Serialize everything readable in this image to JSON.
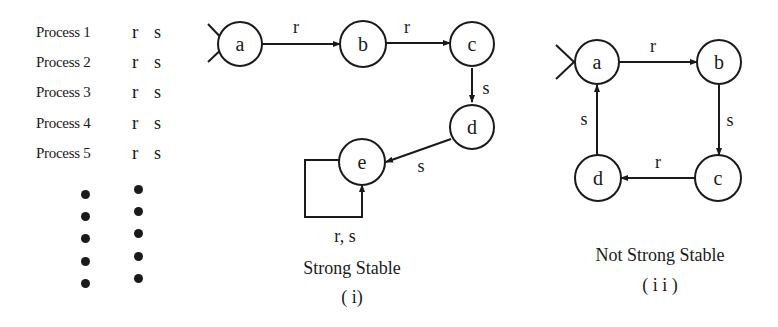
{
  "processes": [
    {
      "name": "Process 1",
      "r": "r",
      "s": "s"
    },
    {
      "name": "Process 2",
      "r": "r",
      "s": "s"
    },
    {
      "name": "Process 3",
      "r": "r",
      "s": "s"
    },
    {
      "name": "Process 4",
      "r": "r",
      "s": "s"
    },
    {
      "name": "Process 5",
      "r": "r",
      "s": "s"
    }
  ],
  "ellipsis_dots": 5,
  "diagram_i": {
    "caption": "Strong Stable",
    "label": "( i)",
    "nodes": [
      {
        "id": "a",
        "label": "a",
        "start": true
      },
      {
        "id": "b",
        "label": "b"
      },
      {
        "id": "c",
        "label": "c"
      },
      {
        "id": "d",
        "label": "d"
      },
      {
        "id": "e",
        "label": "e"
      }
    ],
    "edges": [
      {
        "from": "a",
        "to": "b",
        "label": "r"
      },
      {
        "from": "b",
        "to": "c",
        "label": "r"
      },
      {
        "from": "c",
        "to": "d",
        "label": "s"
      },
      {
        "from": "d",
        "to": "e",
        "label": "s"
      },
      {
        "from": "e",
        "to": "e",
        "label": "r, s"
      }
    ]
  },
  "diagram_ii": {
    "caption": "Not Strong Stable",
    "label": "( i i )",
    "nodes": [
      {
        "id": "a",
        "label": "a",
        "start": true
      },
      {
        "id": "b",
        "label": "b"
      },
      {
        "id": "c",
        "label": "c"
      },
      {
        "id": "d",
        "label": "d"
      }
    ],
    "edges": [
      {
        "from": "a",
        "to": "b",
        "label": "r"
      },
      {
        "from": "b",
        "to": "c",
        "label": "s"
      },
      {
        "from": "c",
        "to": "d",
        "label": "r"
      },
      {
        "from": "d",
        "to": "a",
        "label": "s"
      }
    ]
  }
}
